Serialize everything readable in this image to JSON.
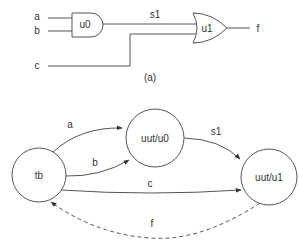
{
  "circuit": {
    "inputs": [
      {
        "id": "a",
        "label": "a"
      },
      {
        "id": "b",
        "label": "b"
      },
      {
        "id": "c",
        "label": "c"
      }
    ],
    "gates": [
      {
        "id": "u0",
        "label": "u0",
        "type": "AND"
      },
      {
        "id": "u1",
        "label": "u1",
        "type": "OR"
      }
    ],
    "signals": {
      "s1": "s1",
      "f": "f"
    },
    "caption": "(a)"
  },
  "graph": {
    "nodes": [
      {
        "id": "tb",
        "label": "tb"
      },
      {
        "id": "u0",
        "label": "uut/u0"
      },
      {
        "id": "u1",
        "label": "uut/u1"
      }
    ],
    "edges": [
      {
        "from": "tb",
        "to": "uut/u0",
        "label": "a",
        "style": "solid"
      },
      {
        "from": "tb",
        "to": "uut/u0",
        "label": "b",
        "style": "solid"
      },
      {
        "from": "uut/u0",
        "to": "uut/u1",
        "label": "s1",
        "style": "solid"
      },
      {
        "from": "tb",
        "to": "uut/u1",
        "label": "c",
        "style": "solid"
      },
      {
        "from": "uut/u1",
        "to": "tb",
        "label": "f",
        "style": "dashed"
      }
    ]
  },
  "colors": {
    "stroke": "#555555",
    "text": "#333333",
    "background": "#ffffff"
  }
}
